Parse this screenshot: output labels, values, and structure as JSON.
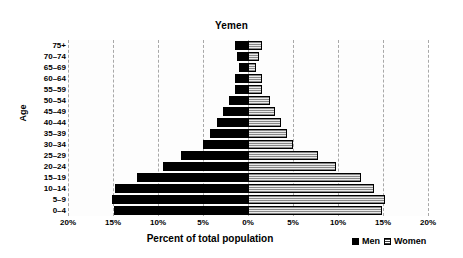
{
  "chart_data": {
    "type": "bar",
    "subtype": "population-pyramid",
    "title": "Yemen",
    "xlabel": "Percent of total population",
    "ylabel": "Age",
    "categories": [
      "0–4",
      "5–9",
      "10–14",
      "15–19",
      "20–24",
      "25–29",
      "30–34",
      "35–39",
      "40–44",
      "45–49",
      "50–54",
      "55–59",
      "60–64",
      "65–69",
      "70–74",
      "75+"
    ],
    "series": [
      {
        "name": "Men",
        "color": "#000000",
        "values": [
          14.9,
          15.1,
          14.8,
          12.3,
          9.4,
          7.4,
          5.0,
          4.2,
          3.4,
          2.8,
          2.1,
          1.4,
          1.5,
          1.0,
          1.2,
          1.4
        ]
      },
      {
        "name": "Women",
        "color": "#e9e9e9",
        "values": [
          14.9,
          15.2,
          14.0,
          12.5,
          9.8,
          7.8,
          5.0,
          4.3,
          3.7,
          3.0,
          2.4,
          1.5,
          1.6,
          0.9,
          1.2,
          1.5
        ]
      }
    ],
    "xlim": [
      -20,
      20
    ],
    "xticks": [
      -20,
      -15,
      -10,
      -5,
      0,
      5,
      10,
      15,
      20
    ],
    "xtick_labels": [
      "20%",
      "15%",
      "10%",
      "5%",
      "0%",
      "5%",
      "10%",
      "15%",
      "20%"
    ],
    "grid": true,
    "grid_style": "dashed-vertical",
    "legend_position": "bottom-right",
    "legend": [
      "Men",
      "Women"
    ]
  },
  "chart": {
    "title": "Yemen",
    "y_axis_title": "Age",
    "x_axis_title": "Percent of total population"
  },
  "legend": {
    "men_label": "Men",
    "women_label": "Women"
  }
}
